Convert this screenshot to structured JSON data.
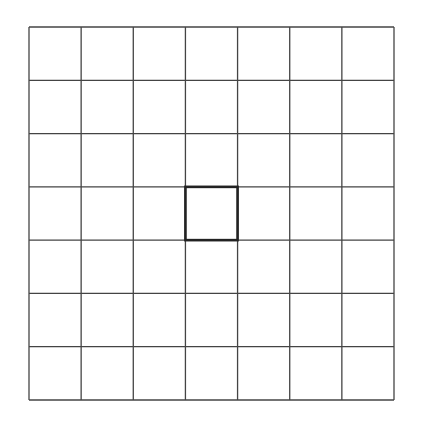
{
  "grid": {
    "rows": 7,
    "cols": 7,
    "left": 29,
    "top": 27,
    "right": 394,
    "bottom": 400,
    "line_color": "#444444",
    "line_width": 1.3,
    "background": "#ffffff"
  },
  "highlight": {
    "row": 3,
    "col": 3,
    "border_color": "#222222",
    "border_width": 2.6
  }
}
